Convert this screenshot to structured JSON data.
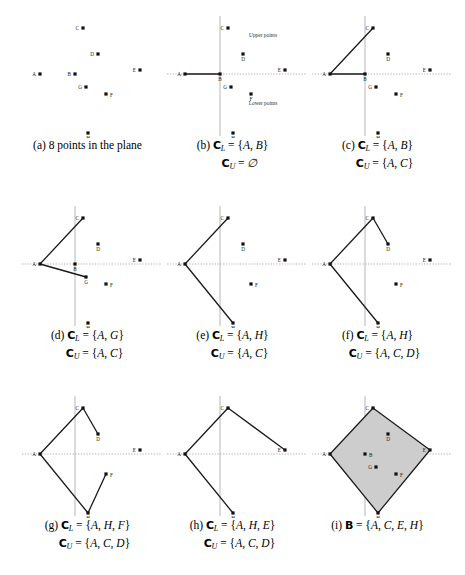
{
  "figure": {
    "point_labels": [
      "A",
      "B",
      "C",
      "D",
      "E",
      "F",
      "G",
      "H"
    ],
    "points": {
      "A": {
        "x": 30,
        "y": 66
      },
      "B": {
        "x": 65,
        "y": 66
      },
      "C": {
        "x": 73,
        "y": 20
      },
      "D": {
        "x": 88,
        "y": 46
      },
      "E": {
        "x": 130,
        "y": 62
      },
      "F": {
        "x": 96,
        "y": 86
      },
      "G": {
        "x": 76,
        "y": 79
      },
      "H": {
        "x": 78,
        "y": 125
      }
    },
    "axis": {
      "x_axis_y": 66,
      "y_axis_x": 65,
      "upper_label": "Upper points",
      "lower_label": "Lower points"
    },
    "hull_fill_color": "#cdcdcd",
    "hull_stroke_color": "#1a1a1a",
    "axis_color": "#9a9a9a",
    "point_color": "#111111"
  },
  "panels": [
    {
      "id": "a",
      "name": "panel-a",
      "caption_line1": "(a) 8 points in the plane",
      "caption_line2": "",
      "show_axes": false,
      "show_axis_labels": false,
      "visible_points": [
        "A",
        "B",
        "C",
        "D",
        "E",
        "F",
        "G",
        "H"
      ],
      "label_sides": {
        "A": "left",
        "B": "left",
        "C": "left",
        "D": "left",
        "E": "left",
        "F": "right",
        "G": "left",
        "H": "below"
      },
      "lower_chain": [],
      "upper_chain": [],
      "filled": false
    },
    {
      "id": "b",
      "name": "panel-b",
      "caption_line1": "(b) ℂL = {A, B}",
      "caption_line2": "ℂU = ∅",
      "c_l": [
        "A",
        "B"
      ],
      "c_u": [],
      "show_axes": true,
      "show_axis_labels": true,
      "visible_points": [
        "A",
        "B",
        "C",
        "D",
        "E",
        "F",
        "G",
        "H"
      ],
      "label_sides": {
        "A": "left",
        "B": "below",
        "C": "left",
        "D": "below",
        "E": "left",
        "F": "below",
        "G": "left",
        "H": "below"
      },
      "lower_chain": [
        "A",
        "B"
      ],
      "upper_chain": [],
      "filled": false
    },
    {
      "id": "c",
      "name": "panel-c",
      "caption_line1": "(c) ℂL = {A, B}",
      "caption_line2": "ℂU = {A, C}",
      "c_l": [
        "A",
        "B"
      ],
      "c_u": [
        "A",
        "C"
      ],
      "show_axes": true,
      "show_axis_labels": false,
      "visible_points": [
        "A",
        "B",
        "C",
        "D",
        "E",
        "F",
        "G",
        "H"
      ],
      "label_sides": {
        "A": "left",
        "B": "below",
        "C": "left",
        "D": "below",
        "E": "left",
        "F": "right",
        "G": "left",
        "H": "below"
      },
      "lower_chain": [
        "A",
        "B"
      ],
      "upper_chain": [
        "A",
        "C"
      ],
      "filled": false
    },
    {
      "id": "d",
      "name": "panel-d",
      "caption_line1": "(d) ℂL = {A, G}",
      "caption_line2": "ℂU = {A, C}",
      "c_l": [
        "A",
        "G"
      ],
      "c_u": [
        "A",
        "C"
      ],
      "show_axes": true,
      "show_axis_labels": false,
      "visible_points": [
        "A",
        "B",
        "C",
        "D",
        "E",
        "F",
        "G",
        "H"
      ],
      "label_sides": {
        "A": "left",
        "B": "below",
        "C": "left",
        "D": "below",
        "E": "left",
        "F": "right",
        "G": "below",
        "H": "below"
      },
      "lower_chain": [
        "A",
        "G"
      ],
      "upper_chain": [
        "A",
        "C"
      ],
      "filled": false
    },
    {
      "id": "e",
      "name": "panel-e",
      "caption_line1": "(e) ℂL = {A, H}",
      "caption_line2": "ℂU = {A, C}",
      "c_l": [
        "A",
        "H"
      ],
      "c_u": [
        "A",
        "C"
      ],
      "show_axes": true,
      "show_axis_labels": false,
      "visible_points": [
        "A",
        "C",
        "D",
        "E",
        "F",
        "H"
      ],
      "label_sides": {
        "A": "left",
        "C": "left",
        "D": "below",
        "E": "left",
        "F": "right",
        "H": "below"
      },
      "lower_chain": [
        "A",
        "H"
      ],
      "upper_chain": [
        "A",
        "C"
      ],
      "filled": false
    },
    {
      "id": "f",
      "name": "panel-f",
      "caption_line1": "(f) ℂL = {A, H}",
      "caption_line2": "ℂU = {A, C, D}",
      "c_l": [
        "A",
        "H"
      ],
      "c_u": [
        "A",
        "C",
        "D"
      ],
      "show_axes": true,
      "show_axis_labels": false,
      "visible_points": [
        "A",
        "C",
        "D",
        "E",
        "F",
        "H"
      ],
      "label_sides": {
        "A": "left",
        "C": "left",
        "D": "below",
        "E": "left",
        "F": "right",
        "H": "below"
      },
      "lower_chain": [
        "A",
        "H"
      ],
      "upper_chain": [
        "A",
        "C",
        "D"
      ],
      "filled": false
    },
    {
      "id": "g",
      "name": "panel-g",
      "caption_line1": "(g) ℂL = {A, H, F}",
      "caption_line2": "ℂU = {A, C, D}",
      "c_l": [
        "A",
        "H",
        "F"
      ],
      "c_u": [
        "A",
        "C",
        "D"
      ],
      "show_axes": true,
      "show_axis_labels": false,
      "visible_points": [
        "A",
        "C",
        "D",
        "E",
        "F",
        "H"
      ],
      "label_sides": {
        "A": "left",
        "C": "left",
        "D": "below",
        "E": "left",
        "F": "right",
        "H": "below"
      },
      "lower_chain": [
        "A",
        "H",
        "F"
      ],
      "upper_chain": [
        "A",
        "C",
        "D"
      ],
      "filled": false
    },
    {
      "id": "h",
      "name": "panel-h",
      "caption_line1": "(h) ℂL = {A, H, E}",
      "caption_line2": "ℂU = {A, C, D}",
      "c_l": [
        "A",
        "H",
        "E"
      ],
      "c_u": [
        "A",
        "C",
        "D"
      ],
      "show_axes": true,
      "show_axis_labels": false,
      "visible_points": [
        "A",
        "C",
        "E",
        "H"
      ],
      "label_sides": {
        "A": "left",
        "C": "left",
        "E": "left",
        "H": "below"
      },
      "lower_chain": [
        "A",
        "H"
      ],
      "upper_chain": [
        "A",
        "C",
        "E"
      ],
      "filled": false
    },
    {
      "id": "i",
      "name": "panel-i",
      "caption_line1": "(i) 𝔹 = {A, C, E, H}",
      "caption_line2": "",
      "hull": [
        "A",
        "C",
        "E",
        "H"
      ],
      "show_axes": true,
      "show_axis_labels": false,
      "visible_points": [
        "A",
        "B",
        "C",
        "D",
        "E",
        "F",
        "G",
        "H"
      ],
      "label_sides": {
        "A": "left",
        "B": "right",
        "C": "left",
        "D": "below",
        "E": "left",
        "F": "right",
        "G": "left",
        "H": "below"
      },
      "lower_chain": [
        "A",
        "H",
        "E"
      ],
      "upper_chain": [
        "A",
        "C",
        "E"
      ],
      "filled": true
    }
  ]
}
